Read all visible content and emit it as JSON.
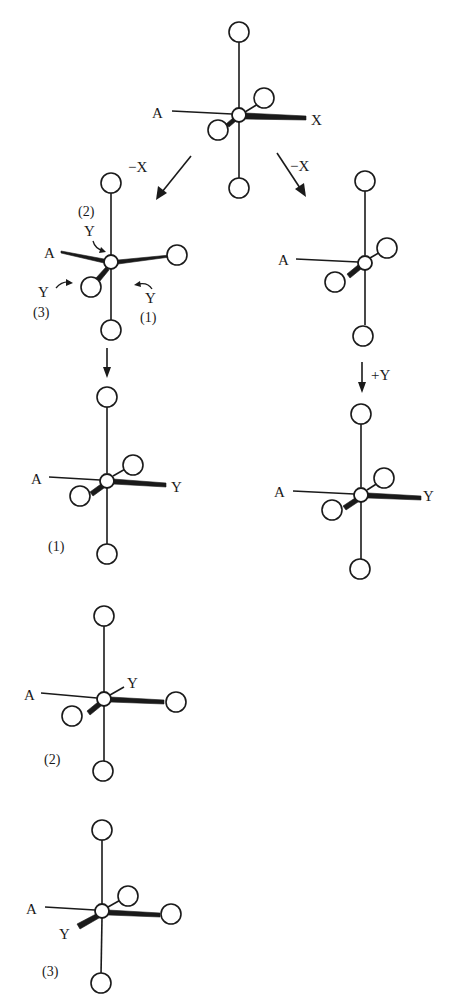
{
  "figure": {
    "colors": {
      "ink": "#1a1a1a",
      "background": "#ffffff"
    }
  },
  "structures": {
    "start": {
      "label_A": "A",
      "label_leaving": "X"
    },
    "left_intermediate": {
      "label_A": "A",
      "entry_points": [
        {
          "number": "(2)",
          "ligand": "Y"
        },
        {
          "number": "(3)",
          "ligand": "Y"
        },
        {
          "number": "(1)",
          "ligand": "Y"
        }
      ]
    },
    "right_intermediate": {
      "label_A": "A"
    },
    "product_1": {
      "label_A": "A",
      "label_entering": "Y",
      "caption": "(1)"
    },
    "product_right": {
      "label_A": "A",
      "label_entering": "Y"
    },
    "product_2": {
      "label_A": "A",
      "label_entering": "Y",
      "caption": "(2)"
    },
    "product_3": {
      "label_A": "A",
      "label_entering": "Y",
      "caption": "(3)"
    }
  },
  "arrows": {
    "left_loss": "−X",
    "right_loss": "−X",
    "left_down": "",
    "right_entry": "+Y"
  }
}
